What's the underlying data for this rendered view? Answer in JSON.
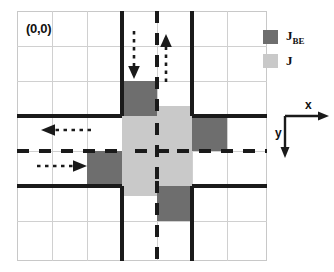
{
  "figure": {
    "type": "diagram",
    "origin_label": "(0,0)"
  },
  "legend": {
    "items": [
      {
        "key": "jbe",
        "label_main": "J",
        "label_sub": "BE",
        "color": "#6e6e6e"
      },
      {
        "key": "j",
        "label_main": "J",
        "label_sub": "",
        "color": "#c9c9c9"
      }
    ]
  },
  "axes": {
    "x_label": "x",
    "y_label": "y",
    "x_direction": "right",
    "y_direction": "down"
  },
  "grid": {
    "columns": 7,
    "rows": 7,
    "cell_size_px": 35,
    "line_color": "#d0d0d0",
    "frame_color": "#c8c8c8"
  },
  "roads": {
    "edge_color": "#1a1a1a",
    "center_line_color": "#1a1a1a",
    "vertical_road_columns": [
      3,
      4
    ],
    "horizontal_road_rows": [
      3,
      4
    ]
  },
  "cells": {
    "j_color": "#c9c9c9",
    "jbe_color": "#6e6e6e",
    "j_cells": [
      {
        "col": 3,
        "row": 3
      },
      {
        "col": 4,
        "row": 3
      },
      {
        "col": 3,
        "row": 4
      },
      {
        "col": 4,
        "row": 4
      }
    ],
    "jbe_cells": [
      {
        "col": 3,
        "row": 2,
        "side": "north"
      },
      {
        "col": 5,
        "row": 3,
        "side": "east"
      },
      {
        "col": 4,
        "row": 5,
        "side": "south"
      },
      {
        "col": 2,
        "row": 4,
        "side": "west"
      }
    ]
  },
  "arrows": [
    {
      "name": "north-inbound-down",
      "direction": "down",
      "x": 129,
      "y": 30
    },
    {
      "name": "north-outbound-up",
      "direction": "up",
      "x": 159,
      "y": 30
    },
    {
      "name": "east-inbound-left",
      "direction": "left",
      "x": 40,
      "y": 118
    },
    {
      "name": "west-outbound-right",
      "direction": "right",
      "x": 40,
      "y": 155
    }
  ]
}
